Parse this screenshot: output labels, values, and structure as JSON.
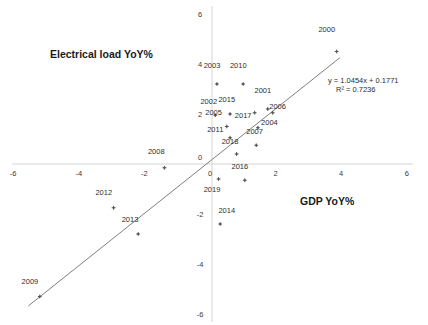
{
  "chart_data": {
    "type": "scatter",
    "title": "",
    "xlabel": "GDP YoY%",
    "ylabel": "Electrical load YoY%",
    "xlim": [
      -6,
      6
    ],
    "ylim": [
      -6,
      6
    ],
    "xticks": [
      "-6",
      "-4",
      "-2",
      "0",
      "2",
      "4",
      "6"
    ],
    "xtick_values": [
      -6,
      -4,
      -2,
      0,
      2,
      4,
      6
    ],
    "yticks": [
      "6",
      "4",
      "2",
      "0",
      "-2",
      "-4",
      "-6"
    ],
    "ytick_values": [
      6,
      4,
      2,
      0,
      -2,
      -4,
      -6
    ],
    "grid": false,
    "legend": "none",
    "marker_color": "#555555",
    "trendline_color": "#6f6f6f",
    "axis_color": "#d4d4d4",
    "trendline": {
      "equation": "y = 1.0454x + 0.1771",
      "r2": "R² = 0.7236",
      "slope": 1.0454,
      "intercept": 0.1771,
      "x_start": -5.6,
      "x_end": 3.9
    },
    "points": [
      {
        "label": "2000",
        "x": 3.8,
        "y": 4.5,
        "lx": 3.5,
        "ly": 5.3
      },
      {
        "label": "2001",
        "x": 1.7,
        "y": 2.2,
        "lx": 1.55,
        "ly": 2.85
      },
      {
        "label": "2002",
        "x": 0.1,
        "y": 1.95,
        "lx": -0.1,
        "ly": 2.4
      },
      {
        "label": "2003",
        "x": 0.15,
        "y": 3.2,
        "lx": 0.0,
        "ly": 3.85
      },
      {
        "label": "2004",
        "x": 1.4,
        "y": 1.45,
        "lx": 1.75,
        "ly": 1.55
      },
      {
        "label": "2005",
        "x": 0.45,
        "y": 1.5,
        "lx": 0.05,
        "ly": 1.95
      },
      {
        "label": "2006",
        "x": 1.85,
        "y": 2.05,
        "lx": 2.0,
        "ly": 2.2
      },
      {
        "label": "2007",
        "x": 1.35,
        "y": 0.75,
        "lx": 1.3,
        "ly": 1.2
      },
      {
        "label": "2008",
        "x": -1.45,
        "y": -0.15,
        "lx": -1.7,
        "ly": 0.4
      },
      {
        "label": "2009",
        "x": -5.25,
        "y": -5.3,
        "lx": -5.55,
        "ly": -4.78
      },
      {
        "label": "2010",
        "x": 0.95,
        "y": 3.2,
        "lx": 0.8,
        "ly": 3.85
      },
      {
        "label": "2011",
        "x": 0.55,
        "y": 1.05,
        "lx": 0.1,
        "ly": 1.3
      },
      {
        "label": "2012",
        "x": -3.0,
        "y": -1.75,
        "lx": -3.3,
        "ly": -1.25
      },
      {
        "label": "2013",
        "x": -2.25,
        "y": -2.8,
        "lx": -2.5,
        "ly": -2.3
      },
      {
        "label": "2014",
        "x": 0.25,
        "y": -2.4,
        "lx": 0.45,
        "ly": -1.95
      },
      {
        "label": "2015",
        "x": 0.55,
        "y": 2.0,
        "lx": 0.45,
        "ly": 2.5
      },
      {
        "label": "2016",
        "x": 1.0,
        "y": -0.65,
        "lx": 0.85,
        "ly": -0.2
      },
      {
        "label": "2017",
        "x": 1.3,
        "y": 2.05,
        "lx": 0.95,
        "ly": 1.85
      },
      {
        "label": "2018",
        "x": 0.75,
        "y": 0.4,
        "lx": 0.55,
        "ly": 0.8
      },
      {
        "label": "2019",
        "x": 0.2,
        "y": -0.6,
        "lx": 0.0,
        "ly": -1.1
      }
    ]
  }
}
